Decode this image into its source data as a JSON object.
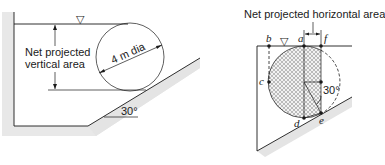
{
  "left_figure": {
    "label_projected": [
      "Net projected",
      "vertical area"
    ],
    "diameter_label": "4 m dia",
    "angle_label": "30°",
    "free_surface_symbol": "▽"
  },
  "right_figure": {
    "title": "Net projected horizontal area",
    "angle_label": "30°",
    "free_surface_symbol": "▽",
    "points": {
      "a": "a",
      "b": "b",
      "c": "c",
      "d": "d",
      "e": "e",
      "f": "f"
    }
  },
  "colors": {
    "shading": "#e6e6e6",
    "line": "#1a1a1a"
  }
}
